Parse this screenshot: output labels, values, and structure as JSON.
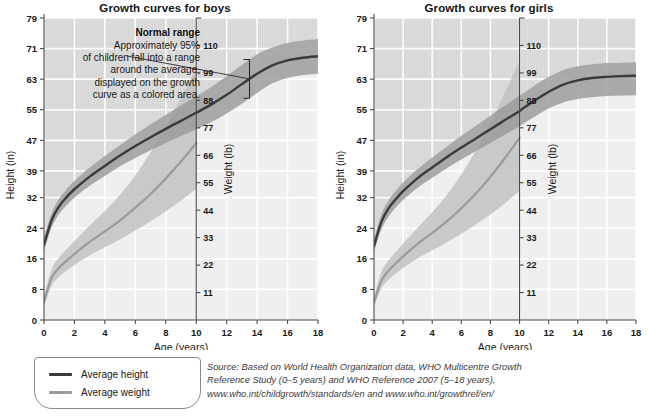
{
  "page": {
    "background": "#ffffff"
  },
  "colors": {
    "height_curve": "#3a3a3a",
    "height_band": "#9a9a9a",
    "weight_curve": "#9b9b9b",
    "weight_band": "#c2c2c2",
    "plot_background": "#efefef",
    "upper_shade": "#dddddd",
    "gridline": "#ffffff",
    "axis": "#4a4a4a",
    "text": "#1a1a1a",
    "source_text": "#3b3b3b"
  },
  "panels": [
    {
      "id": "boys",
      "title": "Growth curves for boys",
      "annotation": {
        "heading": "Normal range",
        "lines": [
          "Approximately 95%",
          "of children fall into a range",
          "around the average,",
          "displayed on the growth",
          "curve as a colored area."
        ],
        "marker_age": 13.5
      }
    },
    {
      "id": "girls",
      "title": "Growth curves for girls",
      "annotation": null
    }
  ],
  "axes": {
    "x": {
      "label": "Age (years)",
      "ticks": [
        0,
        2,
        4,
        6,
        8,
        10,
        12,
        14,
        16,
        18
      ],
      "min": 0,
      "max": 18
    },
    "y_height": {
      "label": "Height (in)",
      "ticks": [
        0,
        8,
        16,
        24,
        32,
        39,
        47,
        55,
        63,
        71,
        79
      ],
      "min": 0,
      "max": 79
    },
    "y_weight": {
      "label": "Weight (lb)",
      "ticks": [
        11,
        22,
        33,
        44,
        55,
        66,
        77,
        88,
        99,
        110
      ],
      "min": 0,
      "max": 121,
      "axis_at_age": 10
    }
  },
  "legend": {
    "items": [
      {
        "label": "Average height",
        "color": "#3a3a3a"
      },
      {
        "label": "Average weight",
        "color": "#9b9b9b"
      }
    ]
  },
  "source": {
    "line1": "Source: Based on World Health Organization data, WHO Multicentre Growth",
    "line2": "Reference Study (0–5 years) and WHO Reference 2007 (5–18 years),",
    "line3": "www.who.int/childgrowth/standards/en and www.who.int/growthref/en/"
  },
  "chart_data": {
    "type": "line",
    "xlabel": "Age (years)",
    "ylabel": "Height (in)",
    "ylabel2": "Weight (lb)",
    "xlim": [
      0,
      18
    ],
    "ylim_height": [
      0,
      79
    ],
    "ylim_weight": [
      0,
      121
    ],
    "grid": true,
    "legend_position": "bottom-left",
    "x": [
      0,
      0.5,
      1,
      1.5,
      2,
      3,
      4,
      5,
      6,
      7,
      8,
      9,
      10,
      11,
      12,
      13,
      14,
      15,
      16,
      17,
      18
    ],
    "series": [
      {
        "name": "Boys average height",
        "panel": "boys",
        "axis": "height",
        "unit": "in",
        "values": [
          19.7,
          26.1,
          29.8,
          32.2,
          34.2,
          37.5,
          40.3,
          43.0,
          45.5,
          47.8,
          50.0,
          52.1,
          54.2,
          56.4,
          58.9,
          61.7,
          64.4,
          66.6,
          67.9,
          68.6,
          69.0
        ],
        "band_lower": [
          18.0,
          24.2,
          27.8,
          30.1,
          32.0,
          35.1,
          37.7,
          40.2,
          42.4,
          44.4,
          46.3,
          48.1,
          49.9,
          51.8,
          54.0,
          56.6,
          59.4,
          61.9,
          63.3,
          64.0,
          64.4
        ],
        "band_upper": [
          21.4,
          28.0,
          31.8,
          34.3,
          36.4,
          39.9,
          42.9,
          45.8,
          48.6,
          51.2,
          53.7,
          56.1,
          58.5,
          61.0,
          63.8,
          66.8,
          69.5,
          71.3,
          72.5,
          73.1,
          73.5
        ]
      },
      {
        "name": "Boys average weight",
        "panel": "boys",
        "axis": "weight",
        "unit": "lb",
        "x": [
          0,
          0.5,
          1,
          1.5,
          2,
          3,
          4,
          5,
          6,
          7,
          8,
          9,
          10
        ],
        "values": [
          7.4,
          16.8,
          21.0,
          23.8,
          26.5,
          31.3,
          35.5,
          39.9,
          45.0,
          50.5,
          56.7,
          63.5,
          70.9
        ],
        "band_lower": [
          5.5,
          13.7,
          17.4,
          19.8,
          22.0,
          25.9,
          29.1,
          32.4,
          35.9,
          39.6,
          43.6,
          47.9,
          52.5
        ],
        "band_upper": [
          9.5,
          20.3,
          25.1,
          28.4,
          31.7,
          37.9,
          43.7,
          50.2,
          58.0,
          67.1,
          77.5,
          89.0,
          101.0
        ]
      },
      {
        "name": "Girls average height",
        "panel": "girls",
        "axis": "height",
        "unit": "in",
        "values": [
          19.4,
          25.6,
          29.2,
          31.6,
          33.7,
          37.1,
          39.9,
          42.6,
          45.1,
          47.5,
          49.9,
          52.3,
          54.7,
          57.3,
          59.7,
          61.6,
          62.7,
          63.3,
          63.6,
          63.8,
          63.9
        ],
        "band_lower": [
          17.8,
          23.6,
          27.0,
          29.4,
          31.4,
          34.6,
          37.2,
          39.7,
          42.0,
          44.2,
          46.3,
          48.5,
          50.7,
          53.1,
          55.3,
          56.9,
          57.8,
          58.3,
          58.6,
          58.7,
          58.8
        ],
        "band_upper": [
          21.0,
          27.5,
          31.3,
          33.8,
          36.0,
          39.5,
          42.5,
          45.4,
          48.2,
          50.8,
          53.5,
          56.1,
          58.7,
          61.3,
          63.6,
          65.4,
          66.4,
          66.9,
          67.2,
          67.3,
          67.4
        ]
      },
      {
        "name": "Girls average weight",
        "panel": "girls",
        "axis": "weight",
        "unit": "lb",
        "x": [
          0,
          0.5,
          1,
          1.5,
          2,
          3,
          4,
          5,
          6,
          7,
          8,
          9,
          10
        ],
        "values": [
          7.1,
          15.6,
          19.8,
          22.7,
          25.5,
          30.5,
          34.9,
          39.5,
          44.8,
          50.7,
          57.4,
          64.9,
          73.0
        ],
        "band_lower": [
          5.2,
          12.6,
          16.1,
          18.6,
          20.8,
          24.7,
          27.9,
          31.2,
          34.6,
          38.3,
          42.3,
          46.8,
          51.8
        ],
        "band_upper": [
          9.2,
          19.1,
          23.9,
          27.3,
          30.6,
          37.0,
          43.2,
          50.1,
          58.4,
          68.0,
          79.0,
          91.2,
          104.0
        ]
      }
    ]
  }
}
